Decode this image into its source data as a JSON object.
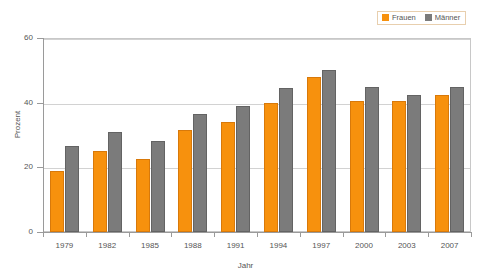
{
  "chart_data": {
    "type": "bar",
    "title": "",
    "xlabel": "Jahr",
    "ylabel": "Prozent",
    "categories": [
      "1979",
      "1982",
      "1985",
      "1988",
      "1991",
      "1994",
      "1997",
      "2000",
      "2003",
      "2007"
    ],
    "series": [
      {
        "name": "Frauen",
        "color": "#F7910D",
        "values": [
          19,
          25,
          22.5,
          31.5,
          34,
          40,
          48,
          40.5,
          40.5,
          42.5
        ]
      },
      {
        "name": "Männer",
        "color": "#7B7B7B",
        "values": [
          26.5,
          31,
          28,
          36.5,
          39,
          44.5,
          50,
          45,
          42.5,
          45
        ]
      }
    ],
    "ylim": [
      0,
      60
    ],
    "yticks": [
      0,
      20,
      40,
      60
    ],
    "ytick_labels": [
      "0",
      "20",
      "40",
      "60"
    ],
    "grid": true,
    "legend_position": "top-right"
  },
  "legend": {
    "entries": [
      {
        "label": "Frauen",
        "color": "#F7910D"
      },
      {
        "label": "Männer",
        "color": "#7B7B7B"
      }
    ]
  },
  "axes": {
    "y_title": "Prozent",
    "x_title": "Jahr"
  }
}
